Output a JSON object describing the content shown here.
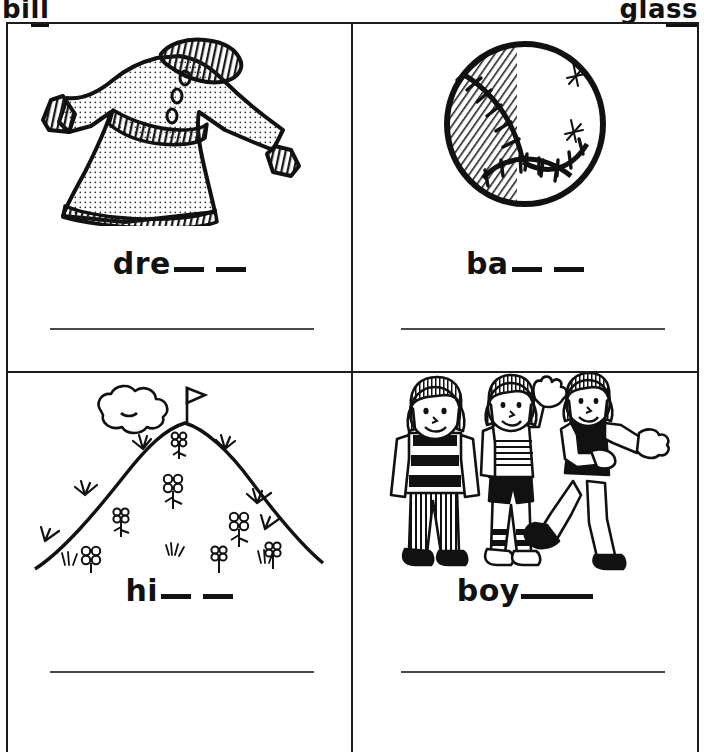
{
  "worksheet": {
    "header_examples": [
      {
        "id": "bill",
        "prefix": "bi",
        "underlined": "ll"
      },
      {
        "id": "glass",
        "prefix": "gla",
        "underlined": "ss"
      }
    ],
    "cells": [
      {
        "id": "dress",
        "picture_name": "dress-illustration",
        "picture_caption": "dress",
        "word_stem": "dre",
        "blanks": 2,
        "blank_style": "two-short",
        "answer_line": true
      },
      {
        "id": "ball",
        "picture_name": "baseball-illustration",
        "picture_caption": "ball",
        "word_stem": "ba",
        "blanks": 2,
        "blank_style": "two-short",
        "answer_line": true
      },
      {
        "id": "hill",
        "picture_name": "hill-illustration",
        "picture_caption": "hill",
        "word_stem": "hi",
        "blanks": 2,
        "blank_style": "two-short",
        "answer_line": true
      },
      {
        "id": "boys",
        "picture_name": "boys-illustration",
        "picture_caption": "boys",
        "word_stem": "boy",
        "blanks": 1,
        "blank_style": "one-long",
        "answer_line": true
      }
    ],
    "colors": {
      "ink": "#111111",
      "rule": "#4a4a4a",
      "paper": "#ffffff"
    }
  }
}
